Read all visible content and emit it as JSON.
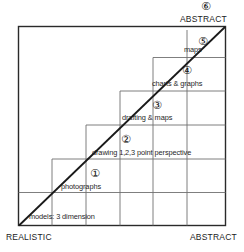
{
  "diagram": {
    "type": "staircase-continuum",
    "axes": {
      "bottom_left_label": "REALISTIC",
      "bottom_right_label": "ABSTRACT",
      "top_right_label": "ABSTRACT"
    },
    "markers": {
      "m1": "①",
      "m2": "②",
      "m3": "③",
      "m4": "④",
      "m5": "⑤",
      "m6": "⑥"
    },
    "steps": [
      {
        "level": "0",
        "label": "models: 3 dimension"
      },
      {
        "level": "1",
        "label": "photographs"
      },
      {
        "level": "2",
        "label": "drawing 1,2,3 point perspective"
      },
      {
        "level": "3",
        "label": "drafting & maps"
      },
      {
        "level": "4",
        "label": "charts & graphs"
      },
      {
        "level": "5",
        "label": "maps"
      }
    ],
    "colors": {
      "ink": "#1a1a1a",
      "grid": "#6d6d6d",
      "background": "#ffffff"
    }
  }
}
